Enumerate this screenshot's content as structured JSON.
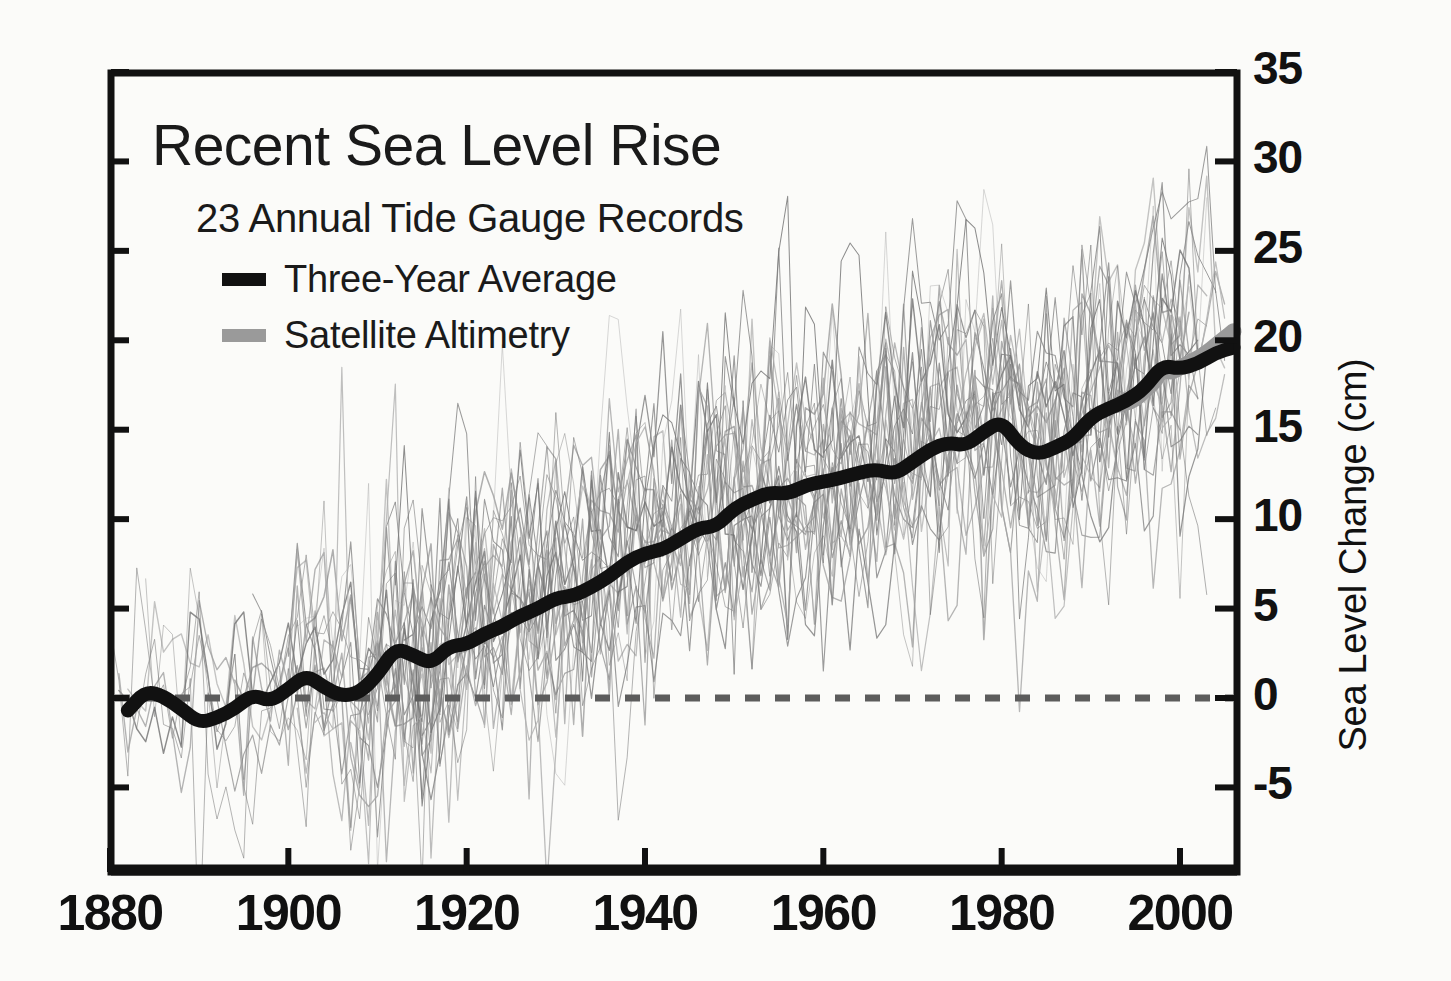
{
  "chart_data": {
    "type": "line",
    "title": "Recent Sea Level Rise",
    "subtitle": "23 Annual Tide Gauge Records",
    "xlabel": "",
    "ylabel": "Sea Level Change (cm)",
    "xlim": [
      1880,
      2006
    ],
    "ylim": [
      -8,
      35
    ],
    "grid": false,
    "legend_position": "top-left",
    "x_ticks": [
      1880,
      1900,
      1920,
      1940,
      1960,
      1980,
      2000
    ],
    "y_ticks": [
      -5,
      0,
      5,
      10,
      15,
      20,
      25,
      30,
      35
    ],
    "zero_reference_line": 0,
    "colors": {
      "three_year_average": "#111111",
      "satellite_altimetry": "#9a9a9a",
      "tide_gauge_records": "#8d8d8d",
      "zero_line": "#5c5c5c",
      "axis": "#111111",
      "background": "#fbfbf9"
    },
    "legend": [
      {
        "label": "Three-Year Average",
        "color": "#111111",
        "swatch": "thick-black-bar"
      },
      {
        "label": "Satellite Altimetry",
        "color": "#9a9a9a",
        "swatch": "thick-gray-bar"
      }
    ],
    "series": [
      {
        "name": "Three-Year Average",
        "type": "line",
        "color": "#111111",
        "x": [
          1882,
          1884,
          1886,
          1888,
          1890,
          1892,
          1894,
          1896,
          1898,
          1900,
          1902,
          1904,
          1906,
          1908,
          1910,
          1912,
          1914,
          1916,
          1918,
          1920,
          1922,
          1924,
          1926,
          1928,
          1930,
          1932,
          1934,
          1936,
          1938,
          1940,
          1942,
          1944,
          1946,
          1948,
          1950,
          1952,
          1954,
          1956,
          1958,
          1960,
          1962,
          1964,
          1966,
          1968,
          1970,
          1972,
          1974,
          1976,
          1978,
          1980,
          1982,
          1984,
          1986,
          1988,
          1990,
          1992,
          1994,
          1996,
          1998,
          2000,
          2002,
          2004,
          2006
        ],
        "y": [
          -0.7,
          0.4,
          0.1,
          -0.6,
          -1.4,
          -1.1,
          -0.6,
          0.2,
          -0.2,
          0.5,
          1.3,
          0.6,
          0.1,
          0.3,
          1.3,
          2.8,
          2.4,
          1.9,
          2.9,
          3.0,
          3.6,
          4.0,
          4.6,
          5.0,
          5.6,
          5.7,
          6.2,
          6.8,
          7.6,
          8.1,
          8.3,
          8.9,
          9.5,
          9.6,
          10.6,
          11.1,
          11.5,
          11.4,
          11.9,
          12.1,
          12.3,
          12.6,
          12.8,
          12.5,
          13.2,
          13.9,
          14.3,
          14.1,
          14.9,
          15.5,
          14.1,
          13.6,
          14.0,
          14.5,
          15.7,
          16.2,
          16.6,
          17.3,
          18.6,
          18.4,
          18.7,
          19.3,
          19.6
        ]
      },
      {
        "name": "Satellite Altimetry",
        "type": "line",
        "color": "#9a9a9a",
        "x": [
          1993,
          1994,
          1995,
          1996,
          1997,
          1998,
          1999,
          2000,
          2001,
          2002,
          2003,
          2004,
          2005,
          2006
        ],
        "y": [
          16.4,
          16.5,
          16.7,
          17.2,
          17.6,
          18.4,
          18.2,
          18.5,
          18.7,
          19.0,
          19.3,
          19.7,
          20.1,
          20.5
        ]
      }
    ],
    "tide_gauge_records_note": "23 individual annual tide gauge records shown as thin gray spaghetti lines with large interannual scatter; envelope widens from about -8 to +8 cm near 1880 to about +5 to +33 cm near 2000."
  },
  "axis": {
    "y_tick_labels": [
      "35",
      "30",
      "25",
      "20",
      "15",
      "10",
      "5",
      "0",
      "-5"
    ],
    "x_tick_labels": [
      "1880",
      "1900",
      "1920",
      "1940",
      "1960",
      "1980",
      "2000"
    ],
    "y_axis_title": "Sea Level Change (cm)"
  }
}
